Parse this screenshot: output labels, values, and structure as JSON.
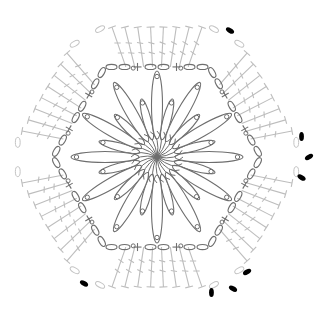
{
  "diagram": {
    "center": [
      157,
      157
    ],
    "colors": {
      "background": "#ffffff",
      "inner_rounds": "#6e6e6e",
      "outer_round": "#bdbdbd",
      "join_chain": "#000000",
      "corner_chain": "#c4c4c4"
    },
    "center_ring": {
      "rays": 24,
      "radius": 26,
      "stitch": "curved cluster ring"
    },
    "petals": {
      "long": {
        "count": 12,
        "inner_r": 18,
        "outer_r": 98,
        "width": 11
      },
      "short": {
        "count": 12,
        "inner_r": 18,
        "outer_r": 60,
        "width": 8
      },
      "picot_dots": {
        "count": 6,
        "radius": 92
      }
    },
    "inner_hexagon": {
      "radius": 104,
      "stitches_per_side": [
        "ch",
        "ch",
        "sc",
        "ch",
        "ch",
        "sc",
        "ch",
        "ch"
      ],
      "legend": {
        "ch": "chain (open oval)",
        "sc": "single crochet (+)"
      }
    },
    "outer_hexagon": {
      "radius": 150,
      "trebles_per_side": 8,
      "stitch": "treble crochet (T with crossbars)",
      "corner_chains": 2
    },
    "join_markers": [
      {
        "corner": "top-right",
        "black_chains": 1
      },
      {
        "corner": "right",
        "black_chains": 3
      },
      {
        "corner": "bottom-right",
        "black_chains": 3
      },
      {
        "corner": "bottom-left",
        "black_chains": 1
      }
    ]
  }
}
